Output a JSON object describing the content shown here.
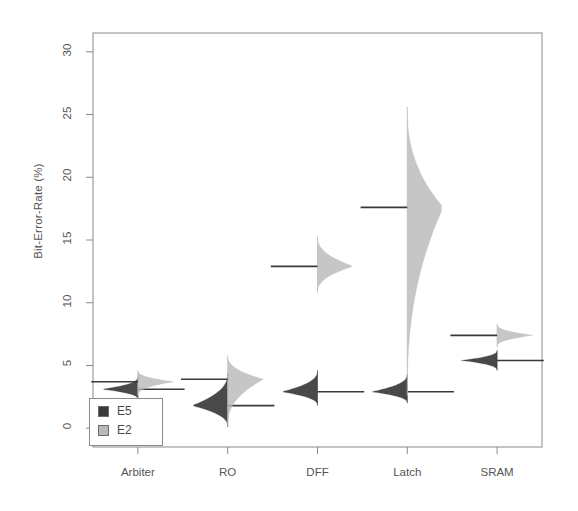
{
  "chart_data": {
    "type": "violin",
    "title": "",
    "xlabel": "",
    "ylabel": "Bit-Error-Rate (%)",
    "categories": [
      "Arbiter",
      "RO",
      "DFF",
      "Latch",
      "SRAM"
    ],
    "ylim": [
      -1.5,
      31.5
    ],
    "yticks": [
      0,
      5,
      10,
      15,
      20,
      25,
      30
    ],
    "ytick_labels": [
      "0",
      "5",
      "10",
      "15",
      "20",
      "25",
      "30"
    ],
    "grid": false,
    "legend": {
      "position": "bottom-left",
      "entries": [
        {
          "name": "E5",
          "color": "#3a3a3a"
        },
        {
          "name": "E2",
          "color": "#b8b8b8"
        }
      ]
    },
    "series": [
      {
        "name": "E5",
        "side": "left",
        "color": "#3a3a3a",
        "means": [
          3.1,
          1.8,
          2.9,
          2.9,
          5.4
        ],
        "spread_min": [
          2.3,
          0.1,
          1.8,
          2.0,
          4.6
        ],
        "spread_max": [
          4.1,
          4.4,
          4.6,
          4.3,
          6.2
        ]
      },
      {
        "name": "E2",
        "side": "right",
        "color": "#b8b8b8",
        "means": [
          3.7,
          3.9,
          12.9,
          17.6,
          7.4
        ],
        "spread_min": [
          2.6,
          0.2,
          10.8,
          2.6,
          6.5
        ],
        "spread_max": [
          4.6,
          5.8,
          15.3,
          25.6,
          8.3
        ]
      }
    ]
  },
  "axes": {
    "y_title": "Bit-Error-Rate (%)"
  }
}
